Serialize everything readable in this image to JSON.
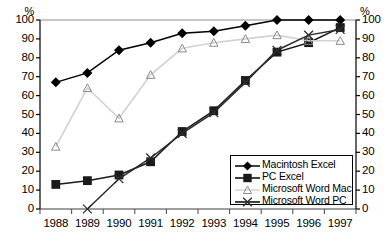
{
  "chart_data": {
    "type": "line",
    "title": "",
    "xlabel": "",
    "ylabel": "%",
    "y_axis_unit_label": "%",
    "categories": [
      "1988",
      "1989",
      "1990",
      "1991",
      "1992",
      "1993",
      "1994",
      "1995",
      "1996",
      "1997"
    ],
    "ylim": [
      0,
      100
    ],
    "yticks": [
      0,
      10,
      20,
      30,
      40,
      50,
      60,
      70,
      80,
      90,
      100
    ],
    "grid": false,
    "dual_y_axis": true,
    "legend_position": "inside-bottom-right",
    "series": [
      {
        "name": "Macintosh Excel",
        "marker": "filled-diamond",
        "color": "#000000",
        "values": [
          67,
          72,
          84,
          88,
          93,
          94,
          97,
          100,
          100,
          100
        ]
      },
      {
        "name": "PC Excel",
        "marker": "filled-square",
        "color": "#1a1a1a",
        "values": [
          13,
          15,
          18,
          25,
          41,
          52,
          68,
          83,
          88,
          96
        ]
      },
      {
        "name": "Microsoft Word Mac",
        "marker": "open-triangle",
        "color": "#c8c8c8",
        "values": [
          33,
          64,
          48,
          71,
          85,
          88,
          90,
          92,
          89,
          89
        ]
      },
      {
        "name": "Microsoft Word PC",
        "marker": "cross-x",
        "color": "#2b2b2b",
        "values": [
          null,
          0,
          16,
          27,
          40,
          51,
          67,
          84,
          92,
          95
        ]
      }
    ]
  },
  "axis": {
    "left_unit": "%",
    "right_unit": "%",
    "left_ticks": [
      "100",
      "90",
      "80",
      "70",
      "60",
      "50",
      "40",
      "30",
      "20",
      "10",
      "0"
    ],
    "right_ticks": [
      "100",
      "90",
      "80",
      "70",
      "60",
      "50",
      "40",
      "30",
      "20",
      "10",
      "0"
    ],
    "x_ticks": [
      "1988",
      "1989",
      "1990",
      "1991",
      "1992",
      "1993",
      "1994",
      "1995",
      "1996",
      "1997"
    ]
  },
  "legend": {
    "items": [
      {
        "label": "Macintosh Excel",
        "marker": "filled-diamond"
      },
      {
        "label": "PC Excel",
        "marker": "filled-square"
      },
      {
        "label": "Microsoft Word Mac",
        "marker": "open-triangle"
      },
      {
        "label": "Microsoft Word PC",
        "marker": "cross-x"
      }
    ]
  }
}
